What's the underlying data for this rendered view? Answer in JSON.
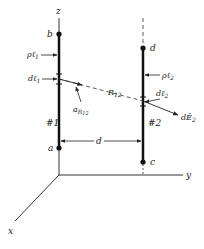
{
  "diagram": {
    "axes": {
      "x": "x",
      "y": "y",
      "z": "z"
    },
    "line1": {
      "id_label": "#1",
      "top_end": "b",
      "bottom_end": "a",
      "charge_density": {
        "main": "ρℓ",
        "sub": "1"
      },
      "element": {
        "main": "dℓ",
        "sub": "1"
      }
    },
    "line2": {
      "id_label": "#2",
      "top_end": "d",
      "bottom_end": "c",
      "charge_density": {
        "main": "ρℓ",
        "sub": "2"
      },
      "element": {
        "main": "dℓ",
        "sub": "2"
      }
    },
    "separation": {
      "main": "R",
      "sub": "12"
    },
    "unit_vector": {
      "main": "a",
      "sub": "R",
      "subsub": "12"
    },
    "field": {
      "main": "dĒ",
      "sub": "2"
    },
    "distance": "d"
  }
}
